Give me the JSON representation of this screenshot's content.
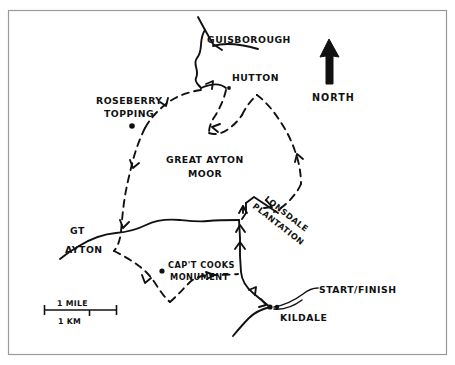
{
  "figure": {
    "background_color": "#ffffff",
    "ink_color": "#111111",
    "frame_color": "#9a9a9a"
  },
  "labels": {
    "guisborough": "GUISBOROUGH",
    "hutton": "HUTTON",
    "roseberry_topping_line1": "ROSEBERRY",
    "roseberry_topping_line2": "TOPPING",
    "great_ayton_moor_line1": "GREAT AYTON",
    "great_ayton_moor_line2": "MOOR",
    "gt_ayton_line1": "GT",
    "gt_ayton_line2": "AYTON",
    "capt_cooks_line1": "CAP'T COOKS",
    "capt_cooks_line2": "MONUMENT",
    "lonsdale_line1": "LONSDALE",
    "lonsdale_line2": "PLANTATION",
    "kildale": "KILDALE",
    "start_finish": "START/FINISH",
    "north": "NORTH"
  },
  "scale_bar": {
    "miles_label": "1 MILE",
    "km_label": "1 KM"
  },
  "map_data": {
    "type": "route-map",
    "places": [
      {
        "name": "GUISBOROUGH",
        "marker": "none",
        "x": 246,
        "y": 40
      },
      {
        "name": "HUTTON",
        "marker": "dot",
        "x": 229,
        "y": 88
      },
      {
        "name": "ROSEBERRY TOPPING",
        "marker": "dot",
        "x": 132,
        "y": 126
      },
      {
        "name": "GREAT AYTON MOOR",
        "marker": "none",
        "x": 192,
        "y": 165
      },
      {
        "name": "GT AYTON",
        "marker": "none",
        "x": 82,
        "y": 235
      },
      {
        "name": "CAP'T COOKS MONUMENT",
        "marker": "dot",
        "x": 162,
        "y": 271
      },
      {
        "name": "LONSDALE PLANTATION",
        "marker": "none",
        "x": 288,
        "y": 215
      },
      {
        "name": "KILDALE",
        "marker": "dot",
        "x": 272,
        "y": 308
      },
      {
        "name": "START/FINISH",
        "marker": "none",
        "x": 314,
        "y": 296
      }
    ],
    "route_style": "dashed",
    "road_style": "solid",
    "direction_arrows": 10,
    "orientation": "north-up"
  }
}
